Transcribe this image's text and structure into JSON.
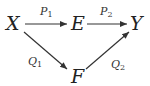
{
  "diagram": {
    "type": "commutative-diagram",
    "nodes": [
      {
        "id": "X",
        "label": "X"
      },
      {
        "id": "E",
        "label": "E"
      },
      {
        "id": "Y",
        "label": "Y"
      },
      {
        "id": "F",
        "label": "F"
      }
    ],
    "edges": [
      {
        "from": "X",
        "to": "E",
        "label": "P",
        "sub": "1"
      },
      {
        "from": "E",
        "to": "Y",
        "label": "P",
        "sub": "2"
      },
      {
        "from": "X",
        "to": "F",
        "label": "Q",
        "sub": "1"
      },
      {
        "from": "F",
        "to": "Y",
        "label": "Q",
        "sub": "2"
      }
    ]
  }
}
